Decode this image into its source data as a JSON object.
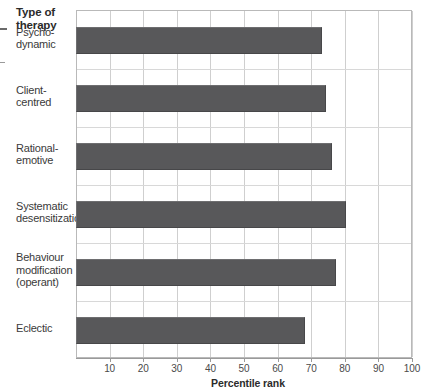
{
  "chart_data": {
    "type": "bar",
    "orientation": "horizontal",
    "title": "",
    "category_axis_title": "Type of therapy",
    "xlabel": "Percentile rank",
    "ylabel": "",
    "xlim": [
      0,
      100
    ],
    "xticks": [
      10,
      20,
      30,
      40,
      50,
      60,
      70,
      80,
      90,
      100
    ],
    "xtick_labels": [
      "10",
      "20",
      "30",
      "40",
      "50",
      "60",
      "70",
      "80",
      "90",
      "100"
    ],
    "grid": "vertical",
    "legend": "none",
    "bar_color": "#58585a",
    "categories": [
      "Psycho-\ndynamic",
      "Client-\ncentred",
      "Rational-\nemotive",
      "Systematic\ndesensitization",
      "Behaviour\nmodification\n(operant)",
      "Eclectic"
    ],
    "category_lines": [
      [
        "Psycho-",
        "dynamic"
      ],
      [
        "Client-",
        "centred"
      ],
      [
        "Rational-",
        "emotive"
      ],
      [
        "Systematic",
        "desensitization"
      ],
      [
        "Behaviour",
        "modification",
        "(operant)"
      ],
      [
        "Eclectic"
      ]
    ],
    "values": [
      73,
      74,
      76,
      80,
      77,
      68
    ]
  },
  "axis": {
    "x_title": "Percentile rank",
    "y_header_line1": "Type of",
    "y_header_line2": "therapy"
  }
}
